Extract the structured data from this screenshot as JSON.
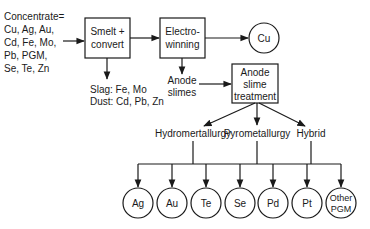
{
  "diagram": {
    "input": {
      "lines": [
        "Concentrate=",
        "Cu, Ag, Au,",
        "Cd, Fe, Mo,",
        "Pb, PGM,",
        "Se, Te, Zn"
      ]
    },
    "nodes": {
      "smelt": {
        "lines": [
          "Smelt +",
          "convert"
        ]
      },
      "electrowinning": {
        "lines": [
          "Electro-",
          "winning"
        ]
      },
      "cu": {
        "label": "Cu"
      },
      "anode_slime_treatment": {
        "lines": [
          "Anode",
          "slime",
          "treatment"
        ]
      }
    },
    "byproducts": {
      "lines": [
        "Slag: Fe, Mo",
        "Dust: Cd, Pb, Zn"
      ]
    },
    "anode_slimes": {
      "lines": [
        "Anode",
        "slimes"
      ]
    },
    "routes": [
      {
        "label": "Hydromertallurgy"
      },
      {
        "label": "Pyrometallurgy"
      },
      {
        "label": "Hybrid"
      }
    ],
    "products": [
      {
        "lines": [
          "Ag"
        ]
      },
      {
        "lines": [
          "Au"
        ]
      },
      {
        "lines": [
          "Te"
        ]
      },
      {
        "lines": [
          "Se"
        ]
      },
      {
        "lines": [
          "Pd"
        ]
      },
      {
        "lines": [
          "Pt"
        ]
      },
      {
        "lines": [
          "Other",
          "PGM"
        ]
      }
    ]
  }
}
